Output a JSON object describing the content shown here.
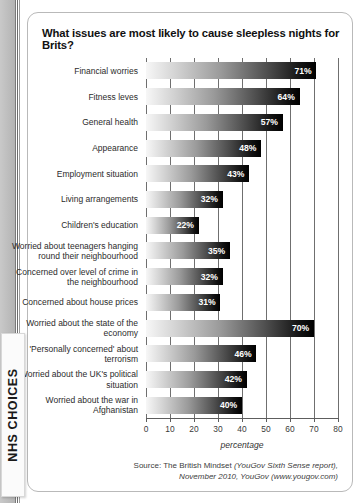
{
  "brand": {
    "tab_label": "NHS CHOICES"
  },
  "card": {
    "title": "What issues are most likely to cause sleepless nights for Brits?",
    "source_lead": "Source: The British Mindset",
    "source_rest": "(YouGov Sixth Sense report), November 2010, YouGov (www.yougov.com)"
  },
  "chart_data": {
    "type": "bar",
    "orientation": "horizontal",
    "title": "What issues are most likely to cause sleepless nights for Brits?",
    "xlabel": "percentage",
    "ylabel": "",
    "xlim": [
      0,
      80
    ],
    "xticks": [
      0,
      10,
      20,
      30,
      40,
      50,
      60,
      70,
      80
    ],
    "grid": true,
    "legend": false,
    "value_suffix": "%",
    "categories": [
      "Financial worries",
      "Fitness leves",
      "General health",
      "Appearance",
      "Employment situation",
      "Living arrangements",
      "Children's education",
      "Worried about teenagers hanging round their neighbourhood",
      "Concerned over level of crime in the neighbourhood",
      "Concerned about house prices",
      "Worried about the state of the economy",
      "'Personally concerned' about terrorism",
      "Worried about the UK's political situation",
      "Worried about the war in Afghanistan"
    ],
    "values": [
      71,
      64,
      57,
      48,
      43,
      32,
      22,
      35,
      32,
      31,
      70,
      46,
      42,
      40
    ],
    "data_labels": [
      "71%",
      "64%",
      "57%",
      "48%",
      "43%",
      "32%",
      "22%",
      "35%",
      "32%",
      "31%",
      "70%",
      "46%",
      "42%",
      "40%"
    ],
    "bar_color_start": "#f7f7f7",
    "bar_color_end": "#000000"
  }
}
